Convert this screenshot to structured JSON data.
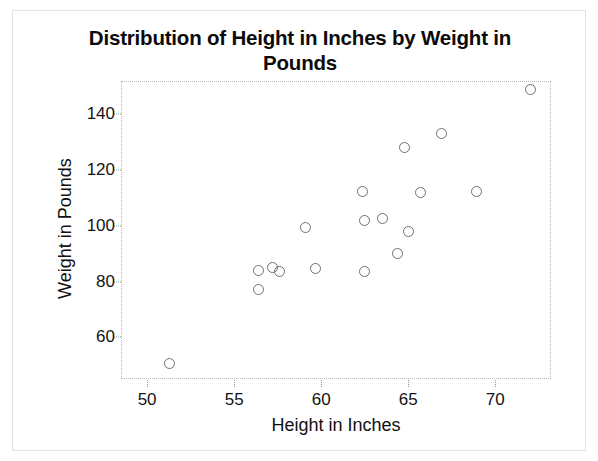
{
  "chart_data": {
    "type": "scatter",
    "title": "Distribution of Height in Inches by Weight in Pounds",
    "xlabel": "Height in Inches",
    "ylabel": "Weight in Pounds",
    "xlim": [
      48.5,
      73.2
    ],
    "ylim": [
      45,
      152
    ],
    "xticks": [
      50,
      55,
      60,
      65,
      70
    ],
    "yticks": [
      60,
      80,
      100,
      120,
      140
    ],
    "xtick_labels": [
      "50",
      "55",
      "60",
      "65",
      "70"
    ],
    "ytick_labels": [
      "60",
      "80",
      "100",
      "120",
      "140"
    ],
    "grid": false,
    "legend": null,
    "marker": "open-circle",
    "marker_color": "#6f6f6f",
    "points": [
      {
        "x": 51.3,
        "y": 50.5
      },
      {
        "x": 56.4,
        "y": 77.0
      },
      {
        "x": 56.4,
        "y": 84.0
      },
      {
        "x": 57.2,
        "y": 85.0
      },
      {
        "x": 57.6,
        "y": 83.5
      },
      {
        "x": 59.1,
        "y": 99.5
      },
      {
        "x": 59.7,
        "y": 84.5
      },
      {
        "x": 62.4,
        "y": 112.5
      },
      {
        "x": 62.5,
        "y": 102.0
      },
      {
        "x": 62.5,
        "y": 83.5
      },
      {
        "x": 63.5,
        "y": 102.5
      },
      {
        "x": 64.4,
        "y": 90.0
      },
      {
        "x": 64.8,
        "y": 128.0
      },
      {
        "x": 65.0,
        "y": 98.0
      },
      {
        "x": 65.7,
        "y": 112.0
      },
      {
        "x": 66.9,
        "y": 133.0
      },
      {
        "x": 68.9,
        "y": 112.5
      },
      {
        "x": 72.0,
        "y": 149.0
      }
    ]
  }
}
